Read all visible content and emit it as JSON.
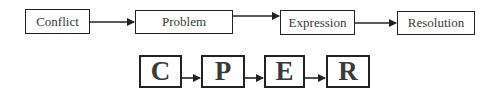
{
  "diagram": {
    "type": "flowchart",
    "top_row": {
      "nodes": [
        {
          "id": "conflict",
          "label": "Conflict"
        },
        {
          "id": "problem",
          "label": "Problem"
        },
        {
          "id": "expression",
          "label": "Expression"
        },
        {
          "id": "resolution",
          "label": "Resolution"
        }
      ],
      "edges": [
        {
          "from": "conflict",
          "to": "problem"
        },
        {
          "from": "problem",
          "to": "expression"
        },
        {
          "from": "expression",
          "to": "resolution"
        }
      ]
    },
    "bottom_row": {
      "nodes": [
        {
          "id": "c",
          "label": "C"
        },
        {
          "id": "p",
          "label": "P"
        },
        {
          "id": "e",
          "label": "E"
        },
        {
          "id": "r",
          "label": "R"
        }
      ],
      "edges": [
        {
          "from": "c",
          "to": "p"
        },
        {
          "from": "p",
          "to": "e"
        },
        {
          "from": "e",
          "to": "r"
        }
      ]
    },
    "colors": {
      "stroke": "#222222",
      "text": "#3a3a3a",
      "background": "#ffffff"
    }
  }
}
